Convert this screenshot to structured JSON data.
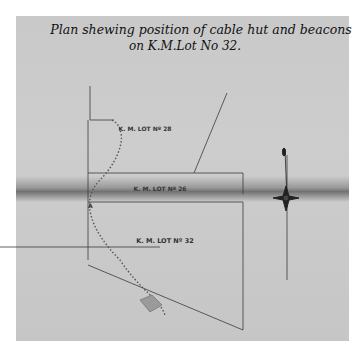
{
  "title": {
    "line1": "Plan shewing position of cable hut and beacons",
    "line2": "on K.M.Lot No 32."
  },
  "lots": [
    {
      "label": "K. M. LOT Nº 28"
    },
    {
      "label": "K. M. LOT Nº 26"
    },
    {
      "label": "K. M. LOT Nº 32"
    }
  ],
  "markers": {
    "corner_a": "A"
  },
  "compass": {
    "icon": "north-arrow-compass-rose"
  },
  "colors": {
    "paper": "#c9c9c9",
    "ink": "#2a2a2a",
    "fold": "#5a5a5a"
  }
}
